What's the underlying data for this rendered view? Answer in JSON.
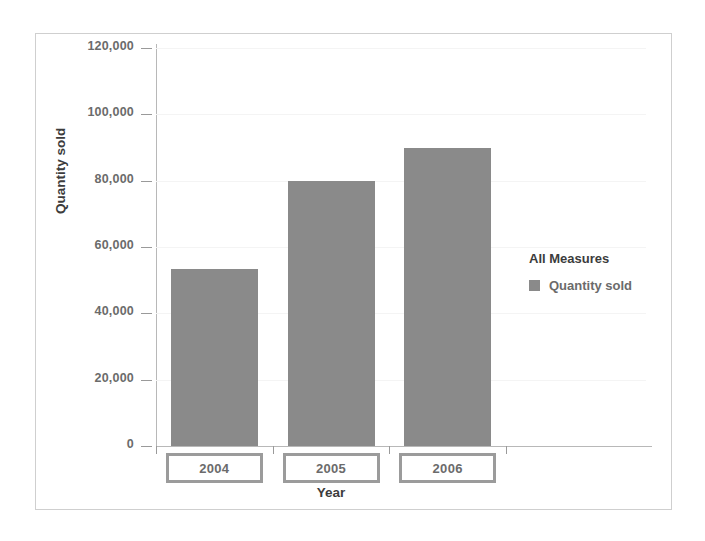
{
  "chart_data": {
    "type": "bar",
    "title": "",
    "xlabel": "Year",
    "ylabel": "Quantity sold",
    "categories": [
      "2004",
      "2005",
      "2006"
    ],
    "values": [
      53400,
      80000,
      90000
    ],
    "series": [
      {
        "name": "Quantity sold",
        "values": [
          53400,
          80000,
          90000
        ]
      }
    ],
    "ylim": [
      0,
      120000
    ],
    "ytick_values": [
      0,
      20000,
      40000,
      60000,
      80000,
      100000,
      120000
    ],
    "ytick_labels": [
      "0",
      "20,000",
      "40,000",
      "60,000",
      "80,000",
      "100,000",
      "120,000"
    ],
    "grid": true,
    "legend_position": "right",
    "legend": {
      "title": "All Measures",
      "entries": [
        {
          "label": "Quantity sold",
          "color": "#8a8a8a"
        }
      ]
    },
    "colors": {
      "bar": "#8a8a8a",
      "axis": "#b8b8b8",
      "grid": "#f4f4f4",
      "tick_label": "#6b6b6b",
      "axis_title": "#3c3c3c",
      "frame_border": "#cfcfcf",
      "category_box_border": "#9b9b9b",
      "background": "#ffffff"
    }
  }
}
